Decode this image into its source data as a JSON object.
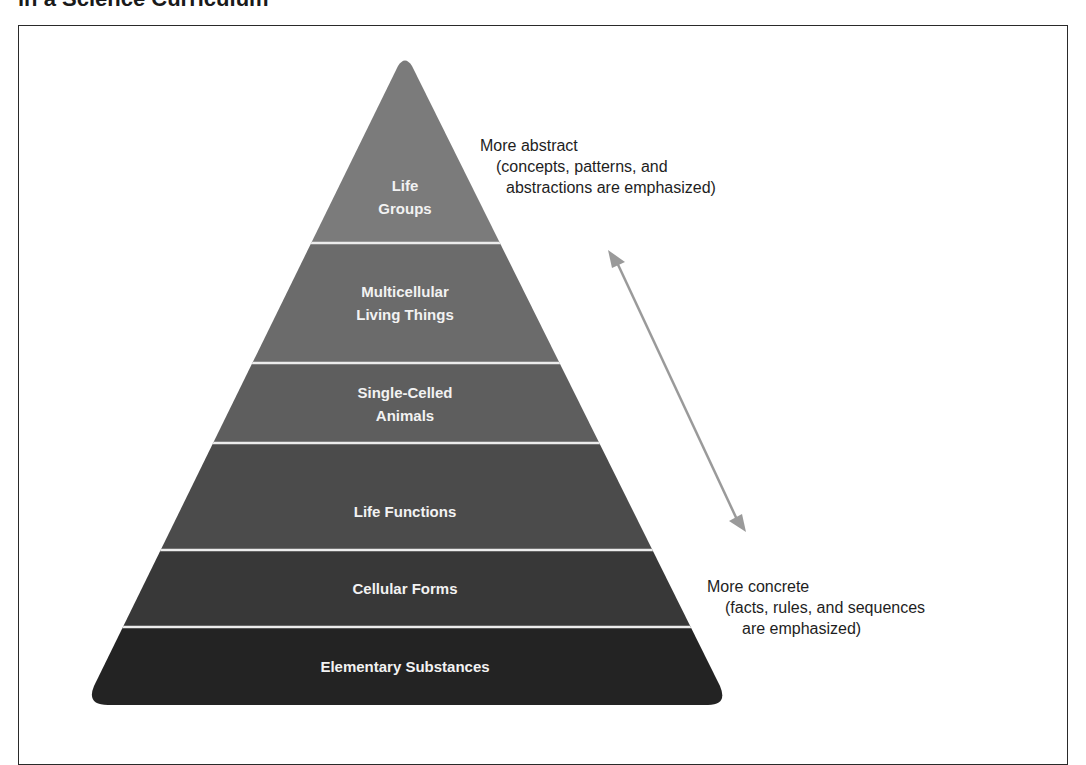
{
  "title": "in a Science Curriculum",
  "pyramid": {
    "tiers": [
      {
        "label_line1": "Life",
        "label_line2": "Groups",
        "color": "#7b7b7b"
      },
      {
        "label_line1": "Multicellular",
        "label_line2": "Living Things",
        "color": "#6b6b6b"
      },
      {
        "label_line1": "Single-Celled",
        "label_line2": "Animals",
        "color": "#5e5e5e"
      },
      {
        "label_line1": "Life Functions",
        "label_line2": "",
        "color": "#4b4b4b"
      },
      {
        "label_line1": "Cellular Forms",
        "label_line2": "",
        "color": "#383838"
      },
      {
        "label_line1": "Elementary Substances",
        "label_line2": "",
        "color": "#232323"
      }
    ],
    "order": "top (most abstract) to bottom (most concrete)"
  },
  "annotations": {
    "abstract": {
      "heading": "More abstract",
      "line2": "(concepts, patterns, and",
      "line3": "abstractions are emphasized)"
    },
    "concrete": {
      "heading": "More concrete",
      "line2": "(facts, rules, and sequences",
      "line3": "are emphasized)"
    }
  },
  "arrow": {
    "type": "double-headed",
    "color": "#9a9a9a"
  }
}
